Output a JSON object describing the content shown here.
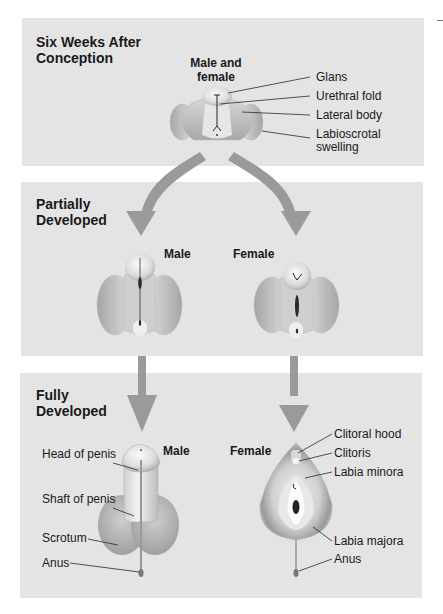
{
  "stages": [
    {
      "title": "Six Weeks After\nConception",
      "subjects": [
        {
          "label": "Male and\nfemale"
        }
      ],
      "labels": [
        "Glans",
        "Urethral fold",
        "Lateral body",
        "Labioscrotal\nswelling"
      ]
    },
    {
      "title": "Partially\nDeveloped",
      "subjects": [
        {
          "label": "Male"
        },
        {
          "label": "Female"
        }
      ]
    },
    {
      "title": "Fully\nDeveloped",
      "subjects": [
        {
          "label": "Male",
          "labels": [
            "Head of penis",
            "Shaft of penis",
            "Scrotum",
            "Anus"
          ]
        },
        {
          "label": "Female",
          "labels": [
            "Clitoral hood",
            "Clitoris",
            "Labia minora",
            "Labia majora",
            "Anus"
          ]
        }
      ]
    }
  ],
  "colors": {
    "panel_bg": "#e4e4e4",
    "arrow": "#9a9a9a",
    "tissue_light": "#f2f2f2",
    "tissue_mid": "#c8c8c8",
    "tissue_dark": "#8f8f8f"
  }
}
